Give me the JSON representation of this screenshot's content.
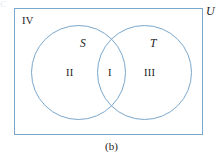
{
  "figure": {
    "caption": "(b)",
    "type": "venn-diagram",
    "colors": {
      "outline": "#7ba7cc",
      "background": "#ffffff",
      "text": "#1a1a1a"
    },
    "universe": {
      "label": "U",
      "outside_region_label": "IV"
    },
    "sets": [
      {
        "id": "S",
        "label": "S",
        "side": "left"
      },
      {
        "id": "T",
        "label": "T",
        "side": "right"
      }
    ],
    "regions": [
      {
        "id": "I",
        "label": "I",
        "meaning": "S intersect T"
      },
      {
        "id": "II",
        "label": "II",
        "meaning": "S only"
      },
      {
        "id": "III",
        "label": "III",
        "meaning": "T only"
      },
      {
        "id": "IV",
        "label": "IV",
        "meaning": "outside S and T"
      }
    ],
    "edge_artifact": "C"
  }
}
